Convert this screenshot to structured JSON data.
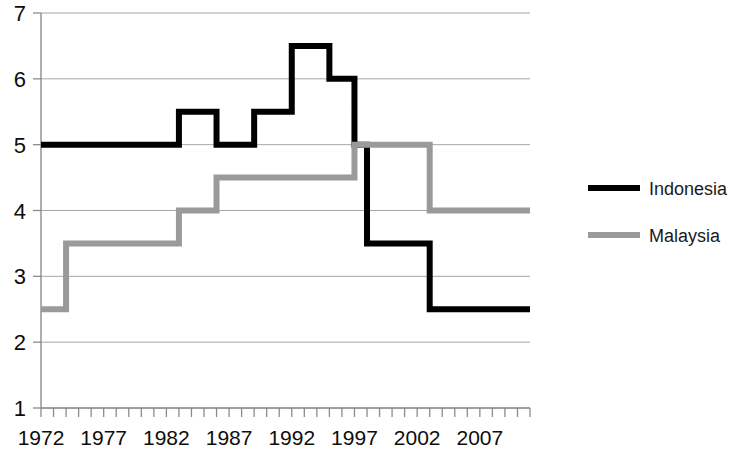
{
  "chart_data": {
    "type": "line",
    "title": "",
    "subtitle": "",
    "xlabel": "",
    "ylabel": "",
    "xlim": [
      1972,
      2011
    ],
    "ylim": [
      1,
      7
    ],
    "yticks": [
      1,
      2,
      3,
      4,
      5,
      6,
      7
    ],
    "ytick_labels": [
      "1",
      "2",
      "3",
      "4",
      "5",
      "6",
      "7"
    ],
    "xticks": [
      1972,
      1977,
      1982,
      1987,
      1992,
      1997,
      2002,
      2007
    ],
    "xtick_labels": [
      "1972",
      "1977",
      "1982",
      "1987",
      "1992",
      "1997",
      "2002",
      "2007"
    ],
    "x_minor_tick_interval": 1,
    "grid": "horizontal",
    "grid_color": "#a6a6a6",
    "legend_position": "right",
    "interpolation": "step",
    "x": [
      1972,
      1973,
      1974,
      1975,
      1976,
      1977,
      1978,
      1979,
      1980,
      1981,
      1982,
      1983,
      1984,
      1985,
      1986,
      1987,
      1988,
      1989,
      1990,
      1991,
      1992,
      1993,
      1994,
      1995,
      1996,
      1997,
      1998,
      1999,
      2000,
      2001,
      2002,
      2003,
      2004,
      2005,
      2006,
      2007,
      2008,
      2009,
      2010,
      2011
    ],
    "series": [
      {
        "name": "Indonesia",
        "color": "#000000",
        "line_width": 6,
        "values": [
          5.0,
          5.0,
          5.0,
          5.0,
          5.0,
          5.0,
          5.0,
          5.0,
          5.0,
          5.0,
          5.0,
          5.5,
          5.5,
          5.5,
          5.0,
          5.0,
          5.0,
          5.5,
          5.5,
          5.5,
          6.5,
          6.5,
          6.5,
          6.0,
          6.0,
          5.0,
          3.5,
          3.5,
          3.5,
          3.5,
          3.5,
          2.5,
          2.5,
          2.5,
          2.5,
          2.5,
          2.5,
          2.5,
          2.5,
          2.5
        ]
      },
      {
        "name": "Malaysia",
        "color": "#9a9a9a",
        "line_width": 6,
        "values": [
          2.5,
          2.5,
          3.5,
          3.5,
          3.5,
          3.5,
          3.5,
          3.5,
          3.5,
          3.5,
          3.5,
          4.0,
          4.0,
          4.0,
          4.5,
          4.5,
          4.5,
          4.5,
          4.5,
          4.5,
          4.5,
          4.5,
          4.5,
          4.5,
          4.5,
          5.0,
          5.0,
          5.0,
          5.0,
          5.0,
          5.0,
          4.0,
          4.0,
          4.0,
          4.0,
          4.0,
          4.0,
          4.0,
          4.0,
          4.0
        ]
      }
    ],
    "legend": [
      {
        "label": "Indonesia",
        "color": "#000000"
      },
      {
        "label": "Malaysia",
        "color": "#9a9a9a"
      }
    ]
  }
}
